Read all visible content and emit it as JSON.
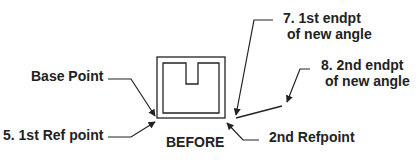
{
  "diagram": {
    "type": "rotate-reference-angle",
    "caption": "BEFORE",
    "colors": {
      "stroke": "#222222",
      "text": "#222222",
      "background": "#ffffff"
    },
    "labels": {
      "base_point": "Base Point",
      "first_ref_point": "5. 1st Ref point",
      "second_ref_point": "2nd Refpoint",
      "first_endpt_line1": "7. 1st endpt",
      "first_endpt_line2": "of new angle",
      "second_endpt_line1": "8. 2nd endpt",
      "second_endpt_line2": "of new angle"
    },
    "shapes": {
      "object": "square-with-inner-square-and-notch",
      "new_angle_line": "short line from lower-right corner upward to the right"
    }
  }
}
